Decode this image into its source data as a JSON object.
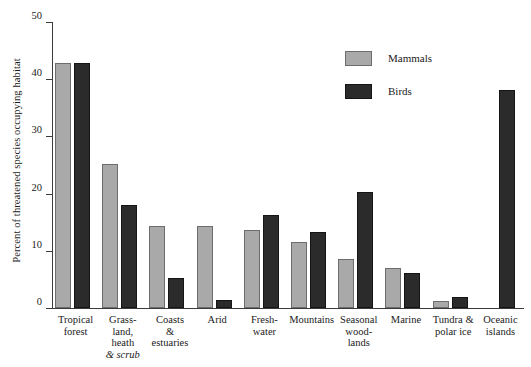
{
  "chart_data": {
    "type": "bar",
    "title": "",
    "xlabel": "",
    "ylabel": "Percent of threatened species occupying habitat",
    "ylim": [
      0,
      50
    ],
    "yticks": [
      0,
      10,
      20,
      30,
      40,
      50
    ],
    "ytick_labels": [
      "0",
      "10",
      "20",
      "30",
      "40",
      "50"
    ],
    "grid": false,
    "legend_position": "top-right",
    "categories": [
      "Tropical forest",
      "Grassland, heath & scrub",
      "Coasts & estuaries",
      "Arid",
      "Freshwater",
      "Mountains",
      "Seasonal woodlands",
      "Marine",
      "Tundra & polar ice",
      "Oceanic islands"
    ],
    "category_lines": [
      [
        "Tropical",
        "forest"
      ],
      [
        "Grass-",
        "land,",
        "heath",
        "& scrub"
      ],
      [
        "Coasts",
        "&",
        "estuaries"
      ],
      [
        "Arid"
      ],
      [
        "Fresh-",
        "water"
      ],
      [
        "Mountains"
      ],
      [
        "Seasonal",
        "wood-",
        "lands"
      ],
      [
        "Marine"
      ],
      [
        "Tundra &",
        "polar ice"
      ],
      [
        "Oceanic",
        "islands"
      ]
    ],
    "series": [
      {
        "name": "Mammals",
        "color": "#a9a9a9",
        "values": [
          42.8,
          25.2,
          14.3,
          14.3,
          13.6,
          11.5,
          8.6,
          7.0,
          1.2,
          null
        ]
      },
      {
        "name": "Birds",
        "color": "#2b2b2b",
        "values": [
          42.8,
          18.0,
          5.2,
          1.4,
          16.2,
          13.3,
          20.3,
          6.2,
          1.9,
          38.2
        ]
      }
    ]
  },
  "legend": {
    "items": [
      {
        "label": "Mammals",
        "color": "#a9a9a9"
      },
      {
        "label": "Birds",
        "color": "#2b2b2b"
      }
    ]
  }
}
